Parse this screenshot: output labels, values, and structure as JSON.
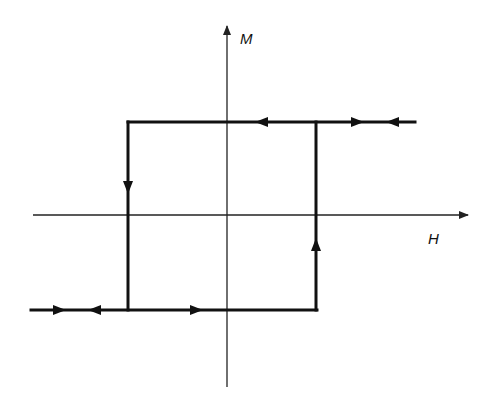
{
  "diagram": {
    "type": "hysteresis-loop",
    "axes": {
      "x_label": "H",
      "y_label": "M"
    },
    "colors": {
      "line": "#111111",
      "axis": "#222222",
      "background": "#ffffff"
    },
    "loop": {
      "shape": "rectangular",
      "top_branch": "positive saturation M",
      "bottom_branch": "negative saturation M",
      "left_switch": "downward transition at negative coercive field",
      "right_switch": "upward transition at positive coercive field"
    },
    "arrows": [
      {
        "location": "top branch, right of M-axis",
        "direction": "left"
      },
      {
        "location": "top extension",
        "direction": "right"
      },
      {
        "location": "top extension end",
        "direction": "left"
      },
      {
        "location": "left vertical",
        "direction": "down"
      },
      {
        "location": "right vertical",
        "direction": "up"
      },
      {
        "location": "bottom extension start",
        "direction": "right"
      },
      {
        "location": "bottom extension",
        "direction": "left"
      },
      {
        "location": "bottom branch, left of M-axis",
        "direction": "right"
      }
    ]
  }
}
